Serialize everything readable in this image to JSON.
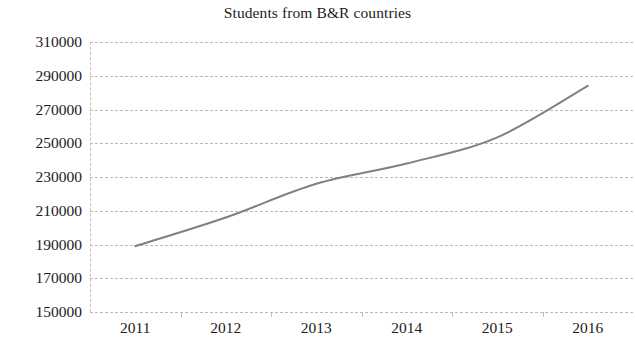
{
  "chart_data": {
    "type": "line",
    "title": "Students from B&R countries",
    "xlabel": "",
    "ylabel": "",
    "categories": [
      "2011",
      "2012",
      "2013",
      "2014",
      "2015",
      "2016"
    ],
    "x": [
      2011,
      2012,
      2013,
      2014,
      2015,
      2016
    ],
    "values": [
      189000,
      206000,
      226000,
      238000,
      253500,
      284000
    ],
    "series": [
      {
        "name": "Students from B&R countries",
        "values": [
          189000,
          206000,
          226000,
          238000,
          253500,
          284000
        ],
        "color": "#808080",
        "line_width": 2,
        "smooth": true,
        "markers": false
      }
    ],
    "ylim": [
      150000,
      310000
    ],
    "ytick_step": 20000,
    "yticks": [
      310000,
      290000,
      270000,
      250000,
      230000,
      210000,
      190000,
      170000,
      150000
    ],
    "ytick_labels": [
      "310000",
      "290000",
      "270000",
      "250000",
      "230000",
      "210000",
      "190000",
      "170000",
      "150000"
    ],
    "xticks": [
      "2011",
      "2012",
      "2013",
      "2014",
      "2015",
      "2016"
    ],
    "grid": {
      "horizontal": true,
      "vertical": false,
      "style": "dashed",
      "color": "#b9b9b9"
    },
    "legend": {
      "visible": false,
      "position": "none"
    },
    "background_color": "#ffffff",
    "axis_color": "#c2c2c2"
  }
}
